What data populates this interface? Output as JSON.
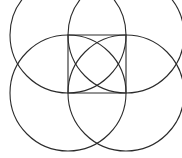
{
  "figure": {
    "canvas": {
      "width": 182,
      "height": 158,
      "background": "#ffffff"
    },
    "stroke_color": "#2b2b2b",
    "stroke_width": 1.1,
    "fill": "none",
    "square": {
      "name": "central-square",
      "x": 68,
      "y": 35,
      "width": 58,
      "height": 58,
      "corners": [
        [
          68,
          35
        ],
        [
          126,
          35
        ],
        [
          126,
          93
        ],
        [
          68,
          93
        ]
      ]
    },
    "circles": [
      {
        "name": "circle-top-left",
        "cx": 68,
        "cy": 35,
        "r": 58
      },
      {
        "name": "circle-top-right",
        "cx": 126,
        "cy": 35,
        "r": 58
      },
      {
        "name": "circle-bottom-left",
        "cx": 68,
        "cy": 93,
        "r": 58
      },
      {
        "name": "circle-bottom-right",
        "cx": 126,
        "cy": 93,
        "r": 58
      }
    ],
    "notes": {
      "circle_count": "4",
      "square_count": "1",
      "description": "Each circle is centered on one corner of the square with radius equal to the square side; top arcs are clipped by the image top edge."
    }
  }
}
